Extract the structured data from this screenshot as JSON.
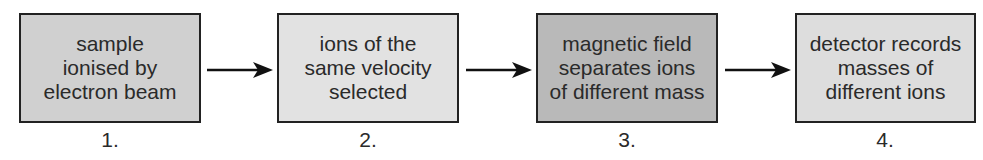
{
  "steps": [
    {
      "number": "1.",
      "text": "sample\nionised by\nelectron beam",
      "fill": "#d0d0d0"
    },
    {
      "number": "2.",
      "text": "ions of the\nsame velocity\nselected",
      "fill": "#e2e2e2"
    },
    {
      "number": "3.",
      "text": "magnetic field\nseparates ions\nof different mass",
      "fill": "#b9b9b9"
    },
    {
      "number": "4.",
      "text": "detector records\nmasses of\ndifferent ions",
      "fill": "#dddddd"
    }
  ],
  "arrows": [
    {
      "from": "1",
      "to": "2",
      "icon": "right-arrow-icon"
    },
    {
      "from": "2",
      "to": "3",
      "icon": "right-arrow-icon"
    },
    {
      "from": "3",
      "to": "4",
      "icon": "right-arrow-icon"
    }
  ]
}
